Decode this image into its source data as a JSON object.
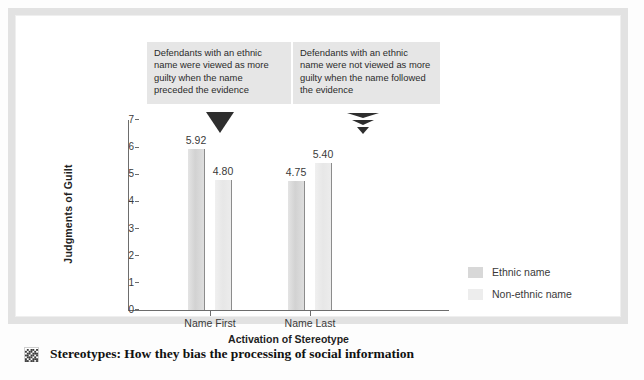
{
  "figure": {
    "callouts": [
      {
        "id": "left",
        "text": "Defendants with an ethnic name were viewed as more guilty when the name preceded the evidence",
        "marker": "solid-down-triangle"
      },
      {
        "id": "right",
        "text": "Defendants with an ethnic name were not viewed as more guilty when the name followed the evidence",
        "marker": "segmented-down-triangle"
      }
    ],
    "caption": {
      "icon": "halftone-square-icon",
      "text": "Stereotypes: How they bias the processing of social information"
    }
  },
  "chart_data": {
    "type": "bar",
    "title": "",
    "xlabel": "Activation of Stereotype",
    "ylabel": "Judgments of Guilt",
    "categories": [
      "Name First",
      "Name Last"
    ],
    "series": [
      {
        "name": "Ethnic name",
        "values": [
          5.92,
          4.75
        ],
        "color": "#d8d8d8"
      },
      {
        "name": "Non-ethnic name",
        "values": [
          4.8,
          5.4
        ],
        "color": "#ededed"
      }
    ],
    "value_labels": [
      [
        "5.92",
        "4.80"
      ],
      [
        "4.75",
        "5.40"
      ]
    ],
    "ylim": [
      0,
      7
    ],
    "yticks": [
      "7",
      "6",
      "5",
      "4",
      "3",
      "2",
      "1",
      "0"
    ],
    "grid": false,
    "legend_position": "right"
  }
}
